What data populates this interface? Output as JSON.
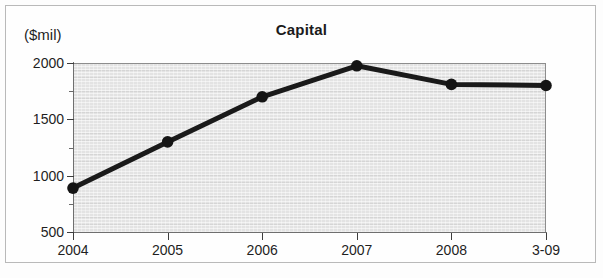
{
  "chart_data": {
    "type": "line",
    "title": "Capital",
    "ylabel": "($mil)",
    "xlabel": "",
    "categories": [
      "2004",
      "2005",
      "2006",
      "2007",
      "2008",
      "3-09"
    ],
    "values": [
      890,
      1300,
      1700,
      1975,
      1810,
      1800
    ],
    "series": [
      {
        "name": "Capital",
        "values": [
          890,
          1300,
          1700,
          1975,
          1810,
          1800
        ]
      }
    ],
    "ylim": [
      500,
      2000
    ],
    "ytick_labels": [
      "2000",
      "1500",
      "1000",
      "500"
    ],
    "ytick_values": [
      2000,
      1500,
      1000,
      500
    ],
    "yminor_values": [
      1750,
      1250,
      750
    ],
    "grid": false,
    "legend": "none",
    "marker": "circle",
    "colors": {
      "line": "#1a1a1a",
      "marker": "#141414",
      "plot_background": "#e3e3e3",
      "axis": "#6f6f6f",
      "text": "#1f1f1f",
      "frame": "#b9b9b9"
    }
  }
}
